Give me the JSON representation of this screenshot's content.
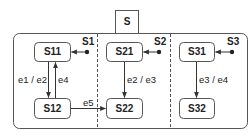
{
  "diagram": {
    "type": "statechart",
    "composite_state": {
      "label": "S",
      "regions": 3
    },
    "states": [
      {
        "id": "S11",
        "label": "S11",
        "region": 1
      },
      {
        "id": "S12",
        "label": "S12",
        "region": 1
      },
      {
        "id": "S21",
        "label": "S21",
        "region": 2
      },
      {
        "id": "S22",
        "label": "S22",
        "region": 2
      },
      {
        "id": "S31",
        "label": "S31",
        "region": 3
      },
      {
        "id": "S32",
        "label": "S32",
        "region": 3
      }
    ],
    "initial_pseudostates": [
      {
        "label": "S1",
        "target": "S11"
      },
      {
        "label": "S2",
        "target": "S21"
      },
      {
        "label": "S3",
        "target": "S31"
      }
    ],
    "transitions": [
      {
        "from": "S11",
        "to": "S12",
        "label": "e1 / e2"
      },
      {
        "from": "S12",
        "to": "S11",
        "label": "e4"
      },
      {
        "from": "S12",
        "to": "S22",
        "label": "e5"
      },
      {
        "from": "S21",
        "to": "S22",
        "label": "e2 / e3"
      },
      {
        "from": "S31",
        "to": "S32",
        "label": "e3 / e4"
      }
    ],
    "colors": {
      "stroke": "#444444",
      "text": "#222222",
      "background": "#ffffff"
    }
  }
}
